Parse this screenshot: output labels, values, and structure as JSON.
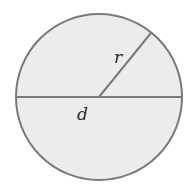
{
  "diagram": {
    "shape": "circle",
    "center": [
      99,
      97
    ],
    "radius": 83,
    "fill_color": "#ececec",
    "stroke_color": "#7a7a7a",
    "radius_label": "r",
    "diameter_label": "d",
    "radius_endpoint": [
      151,
      33
    ]
  }
}
